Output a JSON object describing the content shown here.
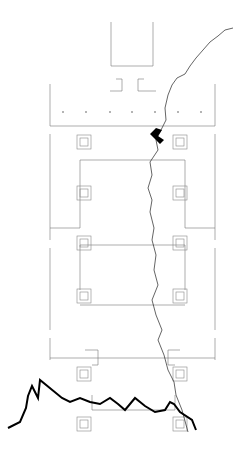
{
  "diagram": {
    "type": "architectural-plan",
    "colors": {
      "walls": "#777777",
      "crack": "#000000",
      "background": "#ffffff"
    },
    "piers_left_x": 84,
    "piers_right_x": 180,
    "pier_rows_y": [
      142,
      193,
      243,
      293,
      374,
      424
    ],
    "bays": [
      {
        "y_top": 125,
        "y_bottom": 160
      },
      {
        "y_top": 173,
        "y_bottom": 210
      },
      {
        "y_top": 223,
        "y_bottom": 260
      },
      {
        "y_top": 273,
        "y_bottom": 340
      }
    ]
  }
}
